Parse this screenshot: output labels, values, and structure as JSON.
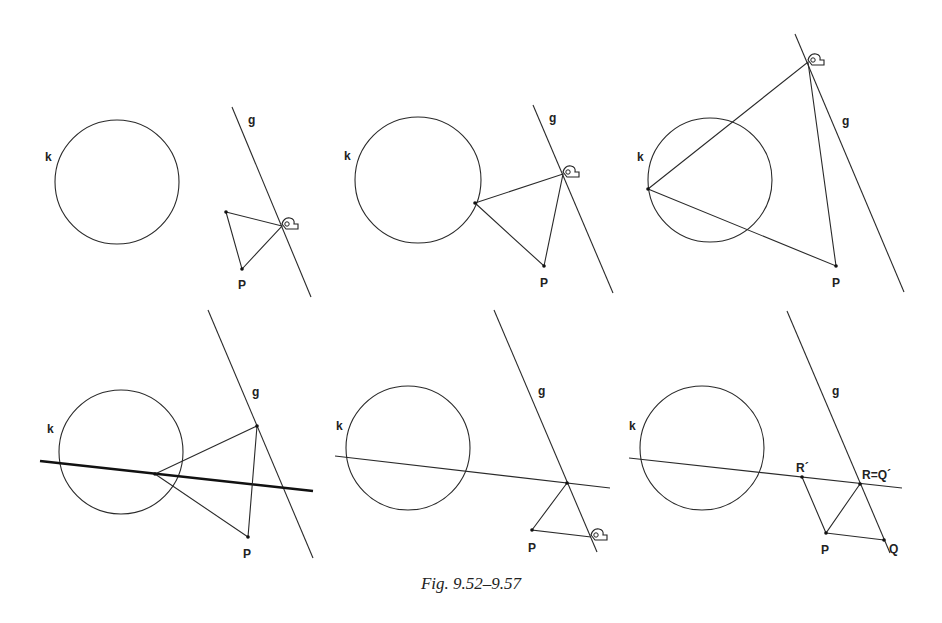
{
  "figure": {
    "caption": "Fig. 9.52–9.57",
    "panels": [
      {
        "id": "9.52",
        "labels": {
          "circle": "k",
          "line": "g",
          "point": "P"
        },
        "has_hand_cursor": true
      },
      {
        "id": "9.53",
        "labels": {
          "circle": "k",
          "line": "g",
          "point": "P"
        },
        "has_hand_cursor": true
      },
      {
        "id": "9.54",
        "labels": {
          "circle": "k",
          "line": "g",
          "point": "P"
        },
        "has_hand_cursor": true
      },
      {
        "id": "9.55",
        "labels": {
          "circle": "k",
          "line": "g",
          "point": "P"
        },
        "has_trace_line": true
      },
      {
        "id": "9.56",
        "labels": {
          "circle": "k",
          "line": "g",
          "point": "P"
        },
        "has_hand_cursor": true
      },
      {
        "id": "9.57",
        "labels": {
          "circle": "k",
          "line": "g",
          "point": "P",
          "r_prime": "R´",
          "r_eq_q": "R=Q´",
          "q": "Q"
        }
      }
    ]
  }
}
